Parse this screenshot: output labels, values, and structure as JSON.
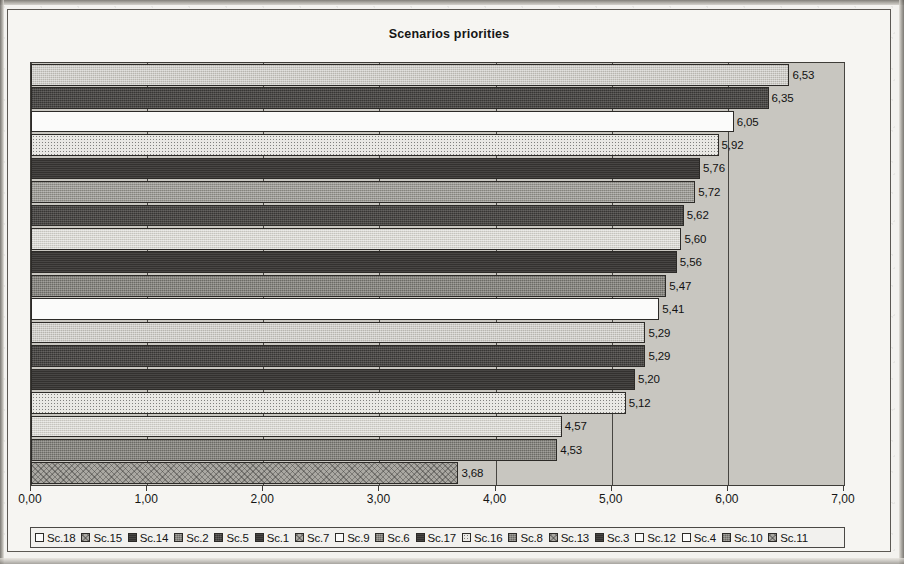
{
  "chart_data": {
    "type": "bar",
    "orientation": "horizontal",
    "title": "Scenarios priorities",
    "xlabel": "",
    "ylabel": "",
    "xlim": [
      0,
      7
    ],
    "xticks": [
      "0,00",
      "1,00",
      "2,00",
      "3,00",
      "4,00",
      "5,00",
      "6,00",
      "7,00"
    ],
    "grid": true,
    "legend_position": "bottom",
    "decimal_separator": ",",
    "categories": [
      "Sc.18",
      "Sc.15",
      "Sc.14",
      "Sc.2",
      "Sc.5",
      "Sc.1",
      "Sc.7",
      "Sc.9",
      "Sc.6",
      "Sc.17",
      "Sc.16",
      "Sc.8",
      "Sc.13",
      "Sc.3",
      "Sc.12",
      "Sc.4",
      "Sc.10",
      "Sc.11"
    ],
    "values": [
      6.53,
      6.35,
      6.05,
      5.92,
      5.76,
      5.72,
      5.62,
      5.6,
      5.56,
      5.47,
      5.41,
      5.29,
      5.29,
      5.2,
      5.12,
      4.57,
      4.53,
      3.68
    ],
    "value_labels": [
      "6,53",
      "6,35",
      "6,05",
      "5,92",
      "5,76",
      "5,72",
      "5,62",
      "5,60",
      "5,56",
      "5,47",
      "5,41",
      "5,29",
      "5,29",
      "5,20",
      "5,12",
      "4,57",
      "4,53",
      "3,68"
    ],
    "fills": [
      "f-ltgray",
      "f-dkgray",
      "f-white",
      "f-dots",
      "f-black",
      "f-gray",
      "f-dkgray",
      "f-vltgray",
      "f-black",
      "f-mdgray",
      "f-white",
      "f-ltgray",
      "f-dkgray",
      "f-black",
      "f-dots",
      "f-vltgray",
      "f-mdgray",
      "f-crosshatch"
    ],
    "legend_swatches": [
      "f-white",
      "f-crosshatch",
      "f-black",
      "f-mdgray",
      "f-dkgray",
      "f-black",
      "f-crosshatch",
      "f-white",
      "f-mdgray",
      "f-black",
      "f-dots",
      "f-mdgray",
      "f-crosshatch",
      "f-black",
      "f-white",
      "f-white",
      "f-mdgray",
      "f-crosshatch"
    ]
  },
  "frame": {
    "plot_background": "#c8c6c0",
    "page_background": "#f3f2ef",
    "border_color": "#5b5853"
  },
  "ghost_text": [
    {
      "text": "the  of  a  scanned  page  as  it  came",
      "x": 118,
      "y": 14
    },
    {
      "text": "ation  of  the  different  scenarios  for",
      "x": 150,
      "y": 36
    },
    {
      "text": "the  distribution  of  weights",
      "x": 420,
      "y": 507
    },
    {
      "text": "a  prioritisation  was  conducted",
      "x": 60,
      "y": 520
    }
  ]
}
